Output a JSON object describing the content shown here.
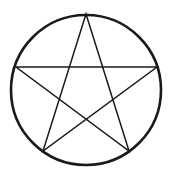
{
  "figure": {
    "canvas": {
      "width": 171,
      "height": 179,
      "background_color": "#ffffff"
    },
    "ink_color": "#1a1a1a",
    "circle": {
      "name": "circumscribed-circle",
      "center_x": 86,
      "center_y": 90,
      "radius": 75,
      "stroke_color": "#1a1a1a",
      "stroke_width": 2.6,
      "fill": "none"
    },
    "star": {
      "name": "pentagram",
      "points": 5,
      "schlafli": "{5/2}",
      "stroke_color": "#1a1a1a",
      "stroke_width": 1.5,
      "fill": "none",
      "closed": true,
      "vertices": [
        {
          "label": "apex",
          "x": 86,
          "y": 14
        },
        {
          "label": "right",
          "x": 157,
          "y": 67
        },
        {
          "label": "bottom-right",
          "x": 129,
          "y": 151
        },
        {
          "label": "bottom-left",
          "x": 43,
          "y": 151
        },
        {
          "label": "left",
          "x": 16,
          "y": 67
        }
      ],
      "draw_order": [
        "apex",
        "bottom-right",
        "left",
        "right",
        "bottom-left",
        "apex"
      ],
      "path": "M 86 14 L 129 151 L 16 67 L 157 67 L 43 151 Z"
    }
  }
}
